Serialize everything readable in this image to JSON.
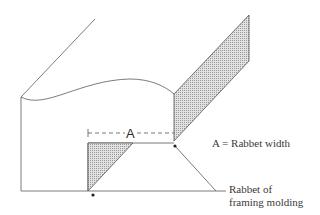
{
  "diagram": {
    "dimension_label": "A",
    "legend": "A = Rabbet width",
    "callout_line1": "Rabbet of",
    "callout_line2": "framing molding",
    "colors": {
      "line": "#555555",
      "hatch_fill": "#c8c8c8",
      "dot": "#222222"
    }
  }
}
